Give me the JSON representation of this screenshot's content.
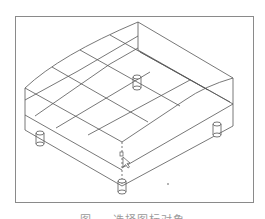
{
  "figure": {
    "caption": "图 — 选择图标对象",
    "frame_color": "#8a8a8a",
    "line_color": "#555555"
  },
  "icons": {
    "cursor": "arrow-cursor-icon"
  }
}
